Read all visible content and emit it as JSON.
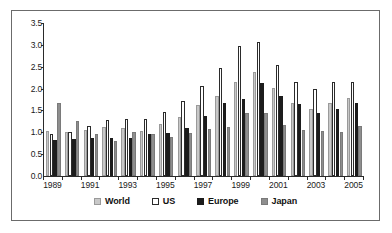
{
  "chart_data": {
    "type": "bar",
    "title": "",
    "subtitle": "",
    "xlabel": "",
    "ylabel": "",
    "ylim": [
      0.0,
      3.5
    ],
    "ytick_labels": [
      "0.0",
      "0.5",
      "1.0",
      "1.5",
      "2.0",
      "2.5",
      "3.0",
      "3.5"
    ],
    "ytick_values": [
      0.0,
      0.5,
      1.0,
      1.5,
      2.0,
      2.5,
      3.0,
      3.5
    ],
    "grid": false,
    "legend_position": "bottom",
    "categories": [
      "1989",
      "1990",
      "1991",
      "1992",
      "1993",
      "1994",
      "1995",
      "1996",
      "1997",
      "1998",
      "1999",
      "2000",
      "2001",
      "2002",
      "2003",
      "2004",
      "2005"
    ],
    "xtick_labels": [
      "1989",
      "1991",
      "1993",
      "1995",
      "1997",
      "1999",
      "2001",
      "2003",
      "2005"
    ],
    "series": [
      {
        "name": "World",
        "color": "#c8c8c8",
        "values": [
          1.02,
          1.01,
          1.06,
          1.12,
          1.1,
          1.04,
          1.19,
          1.34,
          1.63,
          1.82,
          2.14,
          2.38,
          2.01,
          1.68,
          1.54,
          1.66,
          1.79
        ]
      },
      {
        "name": "US",
        "color": "#ffffff",
        "values": [
          0.95,
          1.0,
          1.14,
          1.28,
          1.31,
          1.31,
          1.47,
          1.72,
          2.05,
          2.48,
          2.98,
          3.06,
          2.55,
          2.14,
          2.0,
          2.15,
          2.15
        ]
      },
      {
        "name": "Europe",
        "color": "#1c1c1c",
        "values": [
          0.82,
          0.85,
          0.86,
          0.87,
          0.87,
          0.95,
          0.98,
          1.09,
          1.38,
          1.68,
          1.77,
          2.12,
          1.83,
          1.65,
          1.44,
          1.54,
          1.67
        ]
      },
      {
        "name": "Japan",
        "color": "#8e8e8e",
        "values": [
          1.67,
          1.26,
          0.97,
          0.81,
          1.0,
          0.96,
          0.9,
          0.98,
          1.08,
          1.12,
          1.45,
          1.45,
          1.17,
          1.06,
          1.02,
          1.01,
          1.14
        ]
      }
    ]
  },
  "legend": {
    "items": [
      {
        "label": "World",
        "swatch": "world-swatch"
      },
      {
        "label": "US",
        "swatch": "us-swatch"
      },
      {
        "label": "Europe",
        "swatch": "europe-swatch"
      },
      {
        "label": "Japan",
        "swatch": "japan-swatch"
      }
    ]
  }
}
